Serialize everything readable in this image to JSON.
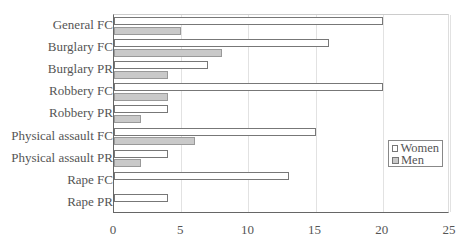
{
  "chart_data": {
    "type": "bar",
    "orientation": "horizontal",
    "title": "",
    "xlabel": "",
    "ylabel": "",
    "categories": [
      "General FC",
      "Burglary FC",
      "Burglary PR",
      "Robbery FC",
      "Robbery PR",
      "Physical assault FC",
      "Physical assault PR",
      "Rape FC",
      "Rape PR"
    ],
    "series": [
      {
        "name": "Women",
        "color": "#ffffff",
        "values": [
          20,
          16,
          7,
          20,
          4,
          15,
          4,
          13,
          4
        ]
      },
      {
        "name": "Men",
        "color": "#c9c9c9",
        "values": [
          5,
          8,
          4,
          4,
          2,
          6,
          2,
          0,
          0
        ]
      }
    ],
    "xlim": [
      0,
      25
    ],
    "xticks": [
      "0",
      "5",
      "10",
      "15",
      "20",
      "25"
    ],
    "grid": "vertical",
    "legend_position": "right, lower-middle inside plot"
  }
}
